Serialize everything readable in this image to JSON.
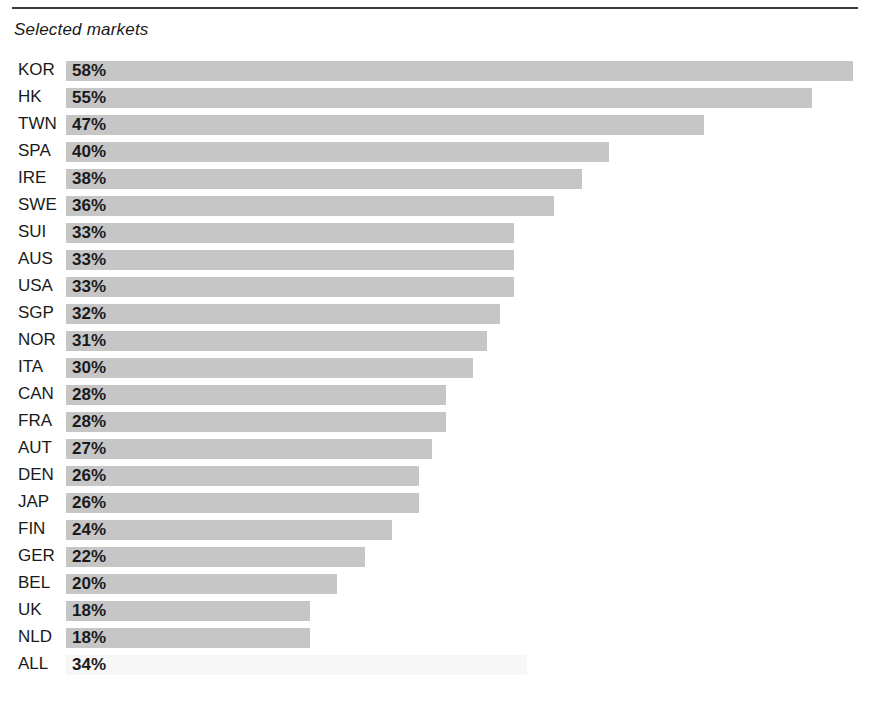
{
  "figure": {
    "title": "Selected markets",
    "rule_color": "#3b3b3b",
    "bar_color": "#c6c6c6",
    "faded_bar_color": "#f7f7f7"
  },
  "chart_data": {
    "type": "bar",
    "orientation": "horizontal",
    "title": "Selected markets",
    "xlabel": "",
    "ylabel": "",
    "xlim": [
      0,
      58
    ],
    "grid": false,
    "legend": false,
    "value_format": "percent",
    "value_suffix": "%",
    "categories": [
      "KOR",
      "HK",
      "TWN",
      "SPA",
      "IRE",
      "SWE",
      "SUI",
      "AUS",
      "USA",
      "SGP",
      "NOR",
      "ITA",
      "CAN",
      "FRA",
      "AUT",
      "DEN",
      "JAP",
      "FIN",
      "GER",
      "BEL",
      "UK",
      "NLD",
      "ALL"
    ],
    "values": [
      58,
      55,
      47,
      40,
      38,
      36,
      33,
      33,
      33,
      32,
      31,
      30,
      28,
      28,
      27,
      26,
      26,
      24,
      22,
      20,
      18,
      18,
      34
    ],
    "labels": [
      "58%",
      "55%",
      "47%",
      "40%",
      "38%",
      "36%",
      "33%",
      "33%",
      "33%",
      "32%",
      "31%",
      "30%",
      "28%",
      "28%",
      "27%",
      "26%",
      "26%",
      "24%",
      "22%",
      "20%",
      "18%",
      "18%",
      "34%"
    ],
    "rows": [
      {
        "category": "KOR",
        "value": 58,
        "label": "58%",
        "faded": false
      },
      {
        "category": "HK",
        "value": 55,
        "label": "55%",
        "faded": false
      },
      {
        "category": "TWN",
        "value": 47,
        "label": "47%",
        "faded": false
      },
      {
        "category": "SPA",
        "value": 40,
        "label": "40%",
        "faded": false
      },
      {
        "category": "IRE",
        "value": 38,
        "label": "38%",
        "faded": false
      },
      {
        "category": "SWE",
        "value": 36,
        "label": "36%",
        "faded": false
      },
      {
        "category": "SUI",
        "value": 33,
        "label": "33%",
        "faded": false
      },
      {
        "category": "AUS",
        "value": 33,
        "label": "33%",
        "faded": false
      },
      {
        "category": "USA",
        "value": 33,
        "label": "33%",
        "faded": false
      },
      {
        "category": "SGP",
        "value": 32,
        "label": "32%",
        "faded": false
      },
      {
        "category": "NOR",
        "value": 31,
        "label": "31%",
        "faded": false
      },
      {
        "category": "ITA",
        "value": 30,
        "label": "30%",
        "faded": false
      },
      {
        "category": "CAN",
        "value": 28,
        "label": "28%",
        "faded": false
      },
      {
        "category": "FRA",
        "value": 28,
        "label": "28%",
        "faded": false
      },
      {
        "category": "AUT",
        "value": 27,
        "label": "27%",
        "faded": false
      },
      {
        "category": "DEN",
        "value": 26,
        "label": "26%",
        "faded": false
      },
      {
        "category": "JAP",
        "value": 26,
        "label": "26%",
        "faded": false
      },
      {
        "category": "FIN",
        "value": 24,
        "label": "24%",
        "faded": false
      },
      {
        "category": "GER",
        "value": 22,
        "label": "22%",
        "faded": false
      },
      {
        "category": "BEL",
        "value": 20,
        "label": "20%",
        "faded": false
      },
      {
        "category": "UK",
        "value": 18,
        "label": "18%",
        "faded": false
      },
      {
        "category": "NLD",
        "value": 18,
        "label": "18%",
        "faded": false
      },
      {
        "category": "ALL",
        "value": 34,
        "label": "34%",
        "faded": true
      }
    ]
  }
}
